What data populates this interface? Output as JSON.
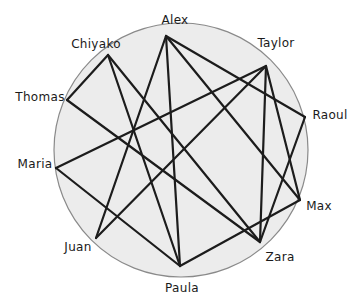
{
  "diagram": {
    "type": "network-circle",
    "circle": {
      "cx": 181,
      "cy": 150,
      "r": 127,
      "fill": "#ececec",
      "stroke": "#8a8a8a"
    },
    "edge_color": "#1c1c1c",
    "nodes": [
      {
        "id": "Alex",
        "label": "Alex",
        "x": 166,
        "y": 36,
        "lx": 175,
        "ly": 20
      },
      {
        "id": "Chiyako",
        "label": "Chiyako",
        "x": 108,
        "y": 55,
        "lx": 96,
        "ly": 44
      },
      {
        "id": "Taylor",
        "label": "Taylor",
        "x": 266,
        "y": 66,
        "lx": 276,
        "ly": 43
      },
      {
        "id": "Thomas",
        "label": "Thomas",
        "x": 67,
        "y": 100,
        "lx": 40,
        "ly": 97
      },
      {
        "id": "Raoul",
        "label": "Raoul",
        "x": 305,
        "y": 117,
        "lx": 330,
        "ly": 115
      },
      {
        "id": "Maria",
        "label": "Maria",
        "x": 56,
        "y": 168,
        "lx": 35,
        "ly": 164
      },
      {
        "id": "Max",
        "label": "Max",
        "x": 300,
        "y": 200,
        "lx": 319,
        "ly": 206
      },
      {
        "id": "Juan",
        "label": "Juan",
        "x": 96,
        "y": 238,
        "lx": 78,
        "ly": 247
      },
      {
        "id": "Zara",
        "label": "Zara",
        "x": 260,
        "y": 242,
        "lx": 280,
        "ly": 257
      },
      {
        "id": "Paula",
        "label": "Paula",
        "x": 180,
        "y": 266,
        "lx": 182,
        "ly": 288
      }
    ],
    "edges": [
      [
        "Alex",
        "Juan"
      ],
      [
        "Alex",
        "Paula"
      ],
      [
        "Alex",
        "Raoul"
      ],
      [
        "Alex",
        "Max"
      ],
      [
        "Chiyako",
        "Thomas"
      ],
      [
        "Chiyako",
        "Paula"
      ],
      [
        "Chiyako",
        "Zara"
      ],
      [
        "Thomas",
        "Zara"
      ],
      [
        "Taylor",
        "Maria"
      ],
      [
        "Taylor",
        "Juan"
      ],
      [
        "Taylor",
        "Zara"
      ],
      [
        "Taylor",
        "Max"
      ],
      [
        "Raoul",
        "Zara"
      ],
      [
        "Maria",
        "Paula"
      ],
      [
        "Max",
        "Paula"
      ]
    ]
  }
}
